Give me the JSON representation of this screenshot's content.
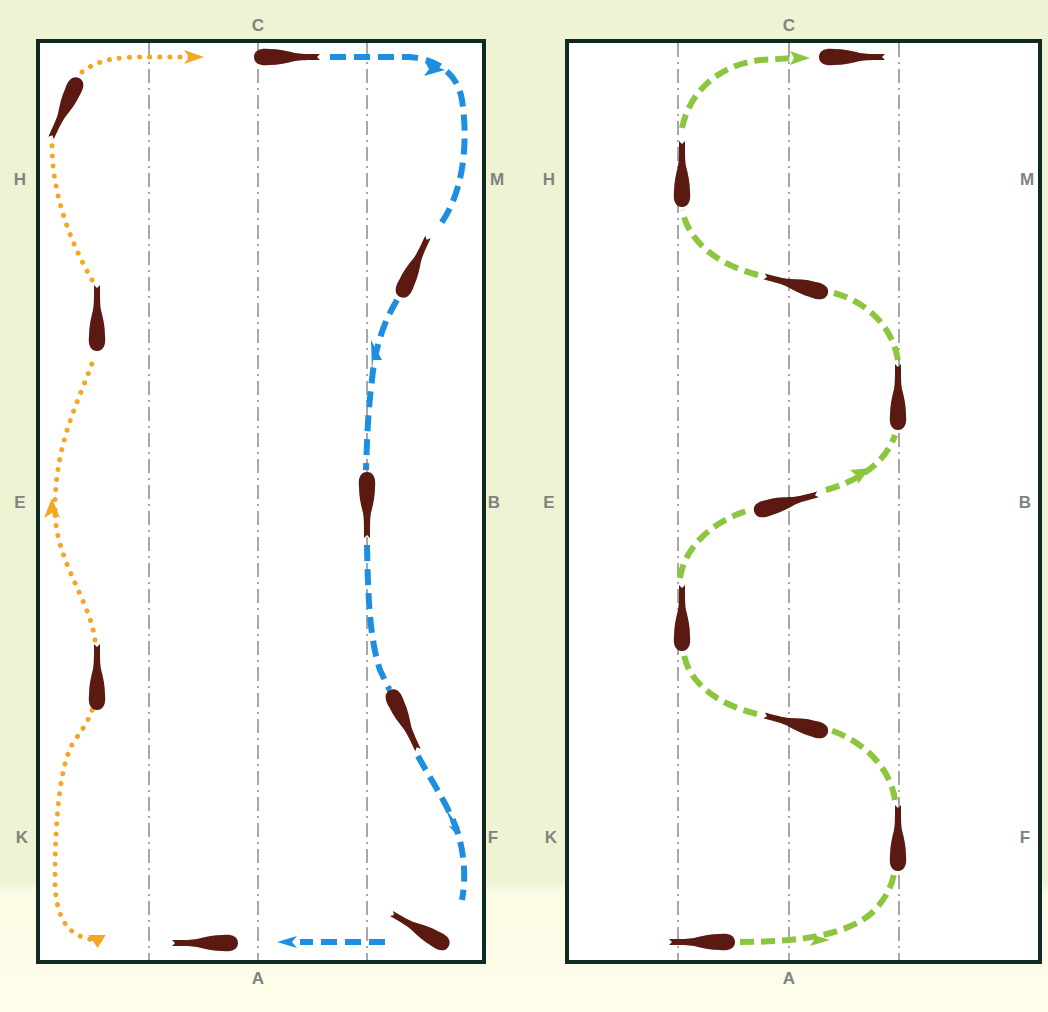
{
  "diagram": {
    "title": "",
    "colors": {
      "background_top": "#eef3d4",
      "background_bottom": "#fdfde9",
      "arena_fill": "#ffffff",
      "arena_border": "#0f2a20",
      "centerline": "#8a8a8a",
      "horse": "#5a1a12",
      "path_orange": "#f5a623",
      "path_blue": "#1e8fe0",
      "path_green": "#8cc63f",
      "letter": "#7e8480"
    },
    "arenas": [
      {
        "id": "left",
        "letters": {
          "top": "C",
          "bottom": "A",
          "left": [
            "H",
            "E",
            "K"
          ],
          "right": [
            "M",
            "B",
            "F"
          ]
        },
        "paths": [
          {
            "name": "orange-dotted-path",
            "style": "dotted",
            "color": "orange",
            "description": "Serpentine along long side H-E-K direction toward C"
          },
          {
            "name": "blue-dashed-path",
            "style": "dashed",
            "color": "blue",
            "description": "From C around M, shallow loop toward B, back to F and A"
          }
        ]
      },
      {
        "id": "right",
        "letters": {
          "top": "C",
          "bottom": "A",
          "left": [
            "H",
            "E",
            "K"
          ],
          "right": [
            "M",
            "B",
            "F"
          ]
        },
        "paths": [
          {
            "name": "green-dashed-path",
            "style": "dashed",
            "color": "green",
            "description": "Three-loop serpentine from A to C"
          }
        ]
      }
    ]
  }
}
